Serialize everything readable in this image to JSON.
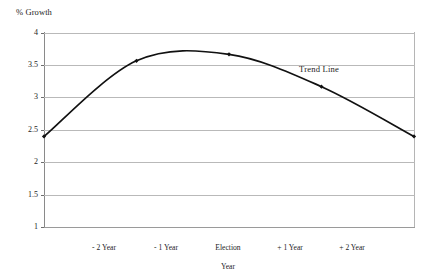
{
  "chart_data": {
    "type": "line",
    "title": "",
    "subtitle": "",
    "xlabel": "",
    "ylabel": "% Growth",
    "ylim": [
      1,
      4
    ],
    "xlim": [
      -2,
      2
    ],
    "grid": "horizontal",
    "legend": "none",
    "categories": [
      "- 2 Year",
      "- 1 Year",
      "Election\nYear",
      "+ 1 Year",
      "+ 2 Year"
    ],
    "x": [
      -2,
      -1,
      0,
      1,
      2
    ],
    "values": [
      2.4,
      3.57,
      3.67,
      3.17,
      2.4
    ],
    "series": [
      {
        "name": "Trend Line",
        "values": [
          2.4,
          3.57,
          3.67,
          3.17,
          2.4
        ]
      }
    ],
    "peak_value": 3.72,
    "y_ticks": [
      "4",
      "3.5",
      "3",
      "2.5",
      "2",
      "1.5",
      "1"
    ],
    "y_tick_values": [
      4,
      3.5,
      3,
      2.5,
      2,
      1.5,
      1
    ],
    "annotations": [
      {
        "text": "Trend Line",
        "x": 1.25,
        "y": 3.35
      }
    ],
    "colors": {
      "line": "#111111",
      "marker": "#111111",
      "grid": "#b9b9b9",
      "axis": "#8a8a8a",
      "background": "#ffffff",
      "text": "#1d1d1d"
    }
  },
  "axes": {
    "y_title": "% Growth",
    "y_ticks": [
      {
        "label": "4",
        "value": 4
      },
      {
        "label": "3.5",
        "value": 3.5
      },
      {
        "label": "3",
        "value": 3
      },
      {
        "label": "2.5",
        "value": 2.5
      },
      {
        "label": "2",
        "value": 2
      },
      {
        "label": "1.5",
        "value": 1.5
      },
      {
        "label": "1",
        "value": 1
      }
    ],
    "x_ticks": [
      {
        "line1": "- 2 Year",
        "line2": ""
      },
      {
        "line1": "- 1 Year",
        "line2": ""
      },
      {
        "line1": "Election",
        "line2": "Year"
      },
      {
        "line1": "+ 1 Year",
        "line2": ""
      },
      {
        "line1": "+ 2 Year",
        "line2": ""
      }
    ]
  },
  "annotation": {
    "trend_line_label": "Trend Line"
  }
}
